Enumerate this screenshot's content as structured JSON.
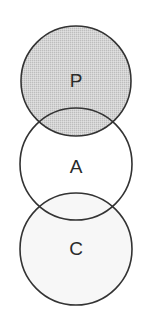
{
  "diagram": {
    "type": "venn-chain",
    "circles": [
      {
        "id": "P",
        "label": "P",
        "cx": 76,
        "cy": 81,
        "r": 55,
        "fill": "#cfcfcf",
        "shaded": true
      },
      {
        "id": "A",
        "label": "A",
        "cx": 76,
        "cy": 164,
        "r": 56,
        "fill": "none",
        "shaded": false
      },
      {
        "id": "C",
        "label": "C",
        "cx": 76,
        "cy": 249,
        "r": 56,
        "fill": "#f7f7f7",
        "shaded": false
      }
    ],
    "stroke_color": "#333333",
    "stroke_width": 1.6
  }
}
